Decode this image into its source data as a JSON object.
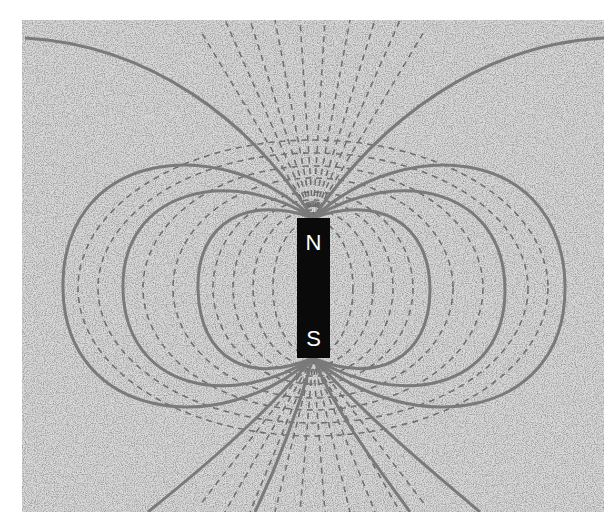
{
  "figure": {
    "background_color": "#d9d9d9",
    "field_line_color": "#7a7a7a",
    "filings_color": "#1e1e1e"
  },
  "magnet": {
    "north_label": "N",
    "south_label": "S",
    "body_color": "#0a0a0a",
    "label_color": "#ffffff"
  }
}
